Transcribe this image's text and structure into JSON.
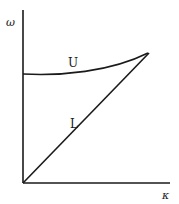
{
  "diagram": {
    "type": "dispersion-relation",
    "axes": {
      "y_label": "ω",
      "x_label": "κ"
    },
    "curves": [
      {
        "name": "upper-branch",
        "label": "U",
        "shape": "slightly concave curve starting at nonzero ω at κ=0, rising to meet L"
      },
      {
        "name": "lower-branch",
        "label": "L",
        "shape": "straight line from origin rising to meet U"
      }
    ],
    "colors": {
      "ink": "#1a1a1a",
      "background": "#ffffff"
    }
  }
}
